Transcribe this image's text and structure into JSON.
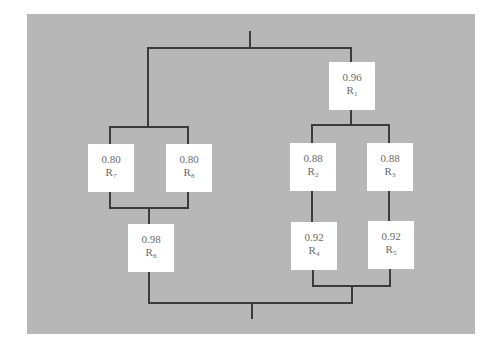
{
  "diagram": {
    "type": "reliability-block-diagram",
    "background_color": "#b7b7b7",
    "line_color": "#3b3b3b",
    "components": [
      {
        "id": "R1",
        "label": "R",
        "sub": "1",
        "reliability": "0.96"
      },
      {
        "id": "R2",
        "label": "R",
        "sub": "2",
        "reliability": "0.88"
      },
      {
        "id": "R3",
        "label": "R",
        "sub": "3",
        "reliability": "0.88"
      },
      {
        "id": "R4",
        "label": "R",
        "sub": "4",
        "reliability": "0.92"
      },
      {
        "id": "R5",
        "label": "R",
        "sub": "5",
        "reliability": "0.92"
      },
      {
        "id": "R6",
        "label": "R",
        "sub": "6",
        "reliability": "0.98"
      },
      {
        "id": "R7",
        "label": "R",
        "sub": "7",
        "reliability": "0.80"
      },
      {
        "id": "R8",
        "label": "R",
        "sub": "8",
        "reliability": "0.80"
      }
    ],
    "structure": {
      "left_branch": "(R7 || R8) -> R6",
      "right_branch": "R1 -> ((R2 -> R4) || (R3 -> R5))",
      "system": "left_branch || right_branch"
    }
  }
}
